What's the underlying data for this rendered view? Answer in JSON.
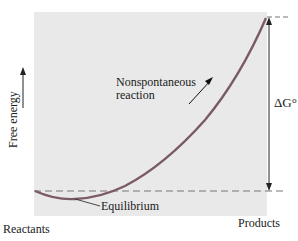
{
  "diagram": {
    "y_axis_label": "Free energy",
    "x_axis_start_label": "Reactants",
    "x_axis_end_label": "Products",
    "curve_annotation_line1": "Nonspontaneous",
    "curve_annotation_line2": "reaction",
    "minimum_label": "Equilibrium",
    "delta_label": "ΔG°",
    "colors": {
      "background_panel": "#e9e9e9",
      "curve": "#7a5a64",
      "dashed_lines": "#777777",
      "text": "#1a1a1a"
    }
  }
}
